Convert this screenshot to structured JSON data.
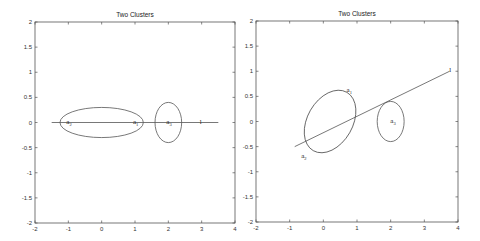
{
  "chart_data": [
    {
      "type": "line",
      "title": "Two Clusters",
      "xlabel": "",
      "ylabel": "",
      "xlim": [
        -2,
        4
      ],
      "ylim": [
        -2,
        2
      ],
      "xticks": [
        "-2",
        "-1",
        "0",
        "1",
        "2",
        "3",
        "4"
      ],
      "yticks": [
        "2",
        "1.5",
        "1",
        "0.5",
        "0",
        "-0.5",
        "-1",
        "-1.5",
        "-2"
      ],
      "grid": false,
      "lines": [
        {
          "name": "l",
          "x": [
            -1.5,
            3.5
          ],
          "y": [
            0,
            0
          ]
        }
      ],
      "ellipses": [
        {
          "name": "cluster-1",
          "center": [
            0,
            0
          ],
          "rx": 1.25,
          "ry": 0.3,
          "angle": 0
        },
        {
          "name": "cluster-2",
          "center": [
            2,
            0
          ],
          "rx": 0.4,
          "ry": 0.4,
          "angle": 0
        }
      ],
      "annotations": [
        {
          "text": "a",
          "sub": "2",
          "x": -1,
          "y": 0
        },
        {
          "text": "a",
          "sub": "1",
          "x": 1,
          "y": 0
        },
        {
          "text": "a",
          "sub": "3",
          "x": 2,
          "y": 0
        },
        {
          "text": "l",
          "sub": "",
          "x": 3,
          "y": 0
        }
      ]
    },
    {
      "type": "line",
      "title": "Two Clusters",
      "xlabel": "",
      "ylabel": "",
      "xlim": [
        -2,
        4
      ],
      "ylim": [
        -2,
        2
      ],
      "xticks": [
        "-2",
        "-1",
        "0",
        "1",
        "2",
        "3",
        "4"
      ],
      "yticks": [
        "2",
        "1.5",
        "1",
        "0.5",
        "0",
        "-0.5",
        "-1",
        "-1.5",
        "-2"
      ],
      "grid": false,
      "lines": [
        {
          "name": "l",
          "x": [
            -0.85,
            3.75
          ],
          "y": [
            -0.5,
            1.0
          ]
        }
      ],
      "ellipses": [
        {
          "name": "cluster-1",
          "center": [
            0.2,
            0.0
          ],
          "rx": 1.0,
          "ry": 0.45,
          "angle": 60
        },
        {
          "name": "cluster-2",
          "center": [
            2,
            0
          ],
          "rx": 0.4,
          "ry": 0.4,
          "angle": 0
        }
      ],
      "annotations": [
        {
          "text": "a",
          "sub": "1",
          "x": 0.75,
          "y": 0.6
        },
        {
          "text": "a",
          "sub": "2",
          "x": -0.6,
          "y": -0.7
        },
        {
          "text": "a",
          "sub": "3",
          "x": 2.05,
          "y": 0
        },
        {
          "text": "l",
          "sub": "",
          "x": 3.8,
          "y": 1.0
        }
      ]
    }
  ]
}
